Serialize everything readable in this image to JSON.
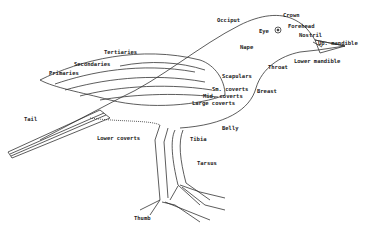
{
  "diagram": {
    "labels": [
      {
        "id": "occiput",
        "text": "Occiput",
        "x": 217,
        "y": 18
      },
      {
        "id": "crown",
        "text": "Crown",
        "x": 283,
        "y": 13
      },
      {
        "id": "forehead",
        "text": "Forehead",
        "x": 288,
        "y": 24
      },
      {
        "id": "eye",
        "text": "Eye",
        "x": 259,
        "y": 29
      },
      {
        "id": "nostril",
        "text": "Nostril",
        "x": 299,
        "y": 33
      },
      {
        "id": "up-mandible",
        "text": "Up. mandible",
        "x": 318,
        "y": 41
      },
      {
        "id": "nape",
        "text": "Nape",
        "x": 240,
        "y": 45
      },
      {
        "id": "lower-mandible",
        "text": "Lower mandible",
        "x": 294,
        "y": 59
      },
      {
        "id": "throat",
        "text": "Throat",
        "x": 268,
        "y": 65
      },
      {
        "id": "tertiaries",
        "text": "Tertiaries",
        "x": 104,
        "y": 50
      },
      {
        "id": "secondaries",
        "text": "Secondaries",
        "x": 74,
        "y": 62
      },
      {
        "id": "primaries",
        "text": "Primaries",
        "x": 49,
        "y": 71
      },
      {
        "id": "scapulars",
        "text": "Scapulars",
        "x": 222,
        "y": 74
      },
      {
        "id": "sm-coverts",
        "text": "Sm. coverts",
        "x": 212,
        "y": 87
      },
      {
        "id": "breast",
        "text": "Breast",
        "x": 257,
        "y": 89
      },
      {
        "id": "mid-coverts",
        "text": "Mid. coverts",
        "x": 203,
        "y": 94
      },
      {
        "id": "large-coverts",
        "text": "Large coverts",
        "x": 192,
        "y": 101
      },
      {
        "id": "tail",
        "text": "Tail",
        "x": 24,
        "y": 117
      },
      {
        "id": "lower-coverts",
        "text": "Lower coverts",
        "x": 97,
        "y": 136
      },
      {
        "id": "belly",
        "text": "Belly",
        "x": 222,
        "y": 126
      },
      {
        "id": "tibia",
        "text": "Tibia",
        "x": 190,
        "y": 137
      },
      {
        "id": "tarsus",
        "text": "Tarsus",
        "x": 197,
        "y": 161
      },
      {
        "id": "thumb",
        "text": "Thumb",
        "x": 134,
        "y": 216
      }
    ]
  }
}
